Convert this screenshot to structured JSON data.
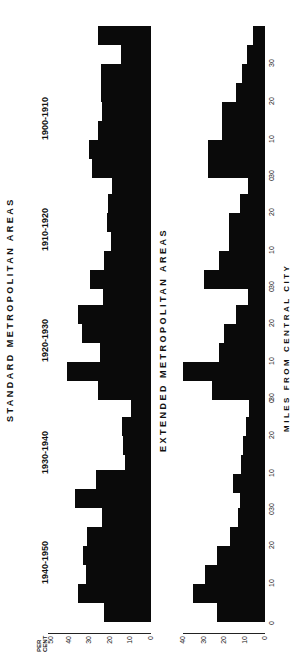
{
  "chart_data": [
    {
      "type": "bar",
      "title": "STANDARD METROPOLITAN AREAS",
      "ylabel": "PER CENT",
      "xlabel": "MILES FROM CENTRAL CITY",
      "ylim": [
        0,
        50
      ],
      "yticks": [
        0,
        10,
        20,
        30,
        40,
        50
      ],
      "xticks": [
        0,
        10,
        20,
        30
      ],
      "categories": [
        "0-5",
        "5-10",
        "10-15",
        "15-20",
        "20-25",
        "25-30",
        "30-35",
        "35+"
      ],
      "series": [
        {
          "name": "1900-1910",
          "values": [
            28.5,
            30,
            25.5,
            24,
            24.5,
            24.5,
            14.5,
            25.5
          ]
        },
        {
          "name": "1910-1920",
          "values": [
            29.5,
            23,
            19.5,
            21.5,
            21,
            19,
            15,
            9.5
          ]
        },
        {
          "name": "1920-1930",
          "values": [
            25.5,
            41,
            25,
            33.5,
            35.5,
            23.5,
            18.5,
            18
          ]
        },
        {
          "name": "1930-1940",
          "values": [
            9.5,
            15.5,
            12.5,
            13.5,
            14,
            9.5,
            11.5,
            9.5
          ]
        },
        {
          "name": "1940-1950",
          "values": [
            23,
            35.5,
            31.5,
            33,
            31,
            24,
            37,
            26.5
          ]
        }
      ]
    },
    {
      "type": "bar",
      "title": "EXTENDED METROPOLITAN AREAS",
      "ylabel": "",
      "xlabel": "MILES FROM CENTRAL CITY",
      "ylim": [
        0,
        40
      ],
      "yticks": [
        0,
        10,
        20,
        30,
        40
      ],
      "xticks": [
        0,
        10,
        20,
        30
      ],
      "categories": [
        "0-5",
        "5-10",
        "10-15",
        "15-20",
        "20-25",
        "25-30",
        "30-35",
        "35+"
      ],
      "series": [
        {
          "name": "1900-1910",
          "values": [
            28,
            28,
            21,
            21,
            14,
            11,
            9,
            6
          ]
        },
        {
          "name": "1910-1920",
          "values": [
            30,
            22.5,
            17.5,
            17.5,
            12,
            8.5,
            7.5,
            4
          ]
        },
        {
          "name": "1920-1930",
          "values": [
            26,
            40,
            22.5,
            20,
            14,
            8.5,
            7.5,
            6.5
          ]
        },
        {
          "name": "1930-1940",
          "values": [
            10,
            15.5,
            11.5,
            10.5,
            9.5,
            8,
            6,
            4.5
          ]
        },
        {
          "name": "1940-1950",
          "values": [
            23.5,
            35,
            29.5,
            23.5,
            17,
            13,
            12,
            9.5
          ]
        }
      ]
    }
  ],
  "labels": {
    "top_title": "STANDARD   METROPOLITAN   AREAS",
    "bottom_title": "EXTENDED   METROPOLITAN   AREAS",
    "x_axis_label": "MILES   FROM   CENTRAL   CITY",
    "per": "PER",
    "cent": "CENT",
    "periods": [
      "1940-1950",
      "1930-1940",
      "1920-1930",
      "1910-1920",
      "1900-1910"
    ]
  }
}
